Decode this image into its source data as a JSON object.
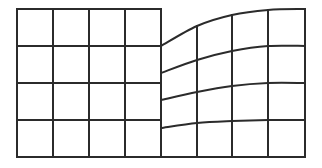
{
  "figure": {
    "width": 322,
    "height": 168,
    "background": "#ffffff",
    "stroke_color": "#2b2b2b",
    "stroke_width": 2
  },
  "regular_grid": {
    "columns": 4,
    "rows": 4,
    "x_lines": [
      17,
      53,
      89,
      125,
      161
    ],
    "y_lines": [
      9,
      46,
      83,
      120,
      157
    ]
  },
  "warped_grid": {
    "columns": 4,
    "rows": 4,
    "x_lines": [
      161,
      197,
      232,
      268,
      305
    ],
    "row_curves": [
      [
        46,
        26,
        15,
        10,
        9
      ],
      [
        73,
        60,
        51,
        46,
        46
      ],
      [
        100,
        92,
        86,
        83,
        83
      ],
      [
        128,
        123,
        121,
        120,
        120
      ],
      [
        157,
        157,
        157,
        157,
        157
      ]
    ]
  }
}
